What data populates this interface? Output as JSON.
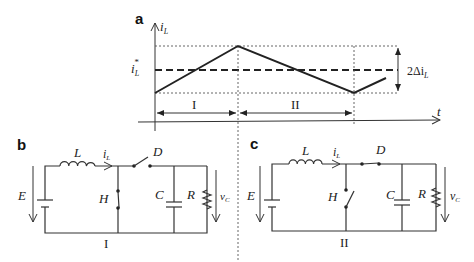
{
  "panels": {
    "a": {
      "label": "a",
      "y_axis_label": "i",
      "y_axis_sub": "L",
      "x_axis_label": "t",
      "reference_label": "i",
      "reference_sub": "L",
      "reference_sup": "*",
      "ripple_label": "2Δi",
      "ripple_sub": "L",
      "interval_1": "I",
      "interval_2": "II"
    },
    "b": {
      "label": "b",
      "source": "E",
      "inductor": "L",
      "current": "i",
      "current_sub": "L",
      "switch_h": "H",
      "diode": "D",
      "capacitor": "C",
      "resistor": "R",
      "voltage": "v",
      "voltage_sub": "C",
      "state": "I"
    },
    "c": {
      "label": "c",
      "source": "E",
      "inductor": "L",
      "current": "i",
      "current_sub": "L",
      "switch_h": "H",
      "diode": "D",
      "capacitor": "C",
      "resistor": "R",
      "voltage": "v",
      "voltage_sub": "C",
      "state": "II"
    }
  }
}
